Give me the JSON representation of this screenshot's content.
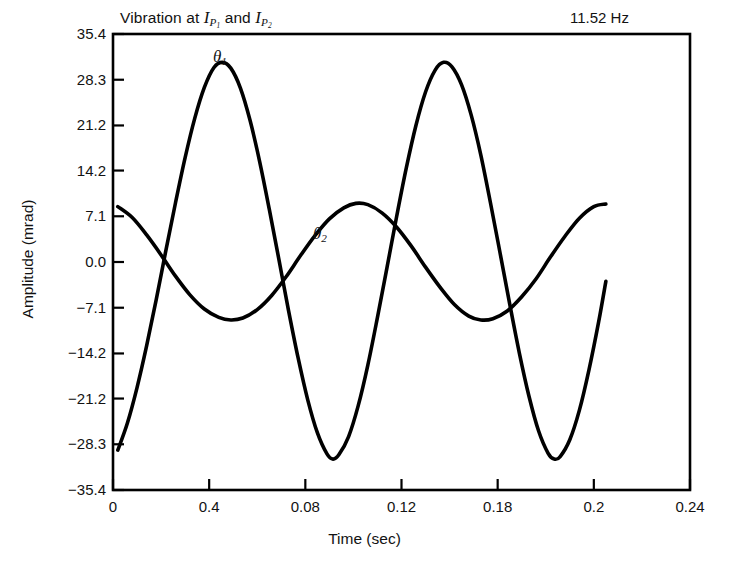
{
  "chart_data": {
    "type": "line",
    "title_parts": {
      "prefix": "Vibration at ",
      "var1": "I",
      "sub1": "P",
      "sub1sub": "1",
      "conj": " and ",
      "var2": "I",
      "sub2": "P",
      "sub2sub": "2"
    },
    "annotation": "11.52 Hz",
    "xlabel": "Time (sec)",
    "ylabel": "Amplitude (mrad)",
    "xlim": [
      0,
      0.24
    ],
    "ylim": [
      -35.4,
      35.4
    ],
    "grid": false,
    "legend": "inline-curve-labels",
    "xticks": [
      0,
      0.04,
      0.08,
      0.12,
      0.16,
      0.2,
      0.24
    ],
    "xticklabels": [
      "0",
      "0.4",
      "0.08",
      "0.12",
      "0.18",
      "0.2",
      "0.24"
    ],
    "yticks": [
      35.4,
      28.3,
      21.2,
      14.2,
      7.1,
      0.0,
      -7.1,
      -14.2,
      -21.2,
      -28.3,
      -35.4
    ],
    "yticklabels": [
      "35.4",
      "28.3",
      "21.2",
      "14.2",
      "7.1",
      "0.0",
      "−7.1",
      "−14.2",
      "−21.2",
      "−28.3",
      "−35.4"
    ],
    "series": [
      {
        "name": "θ₁",
        "label": "θ",
        "label_sub": "1",
        "color": "#000000",
        "linewidth": 3.6,
        "frequency_hz": 11.52,
        "amplitude": 31.0,
        "period": 0.0868,
        "phase_deg": 250,
        "x_start": 0.002,
        "x_end": 0.205,
        "points": [
          [
            0.002,
            -29.2
          ],
          [
            0.006,
            -25.0
          ],
          [
            0.01,
            -19.5
          ],
          [
            0.014,
            -13.0
          ],
          [
            0.018,
            -5.8
          ],
          [
            0.022,
            1.8
          ],
          [
            0.026,
            9.2
          ],
          [
            0.03,
            16.2
          ],
          [
            0.034,
            22.3
          ],
          [
            0.038,
            27.1
          ],
          [
            0.042,
            30.2
          ],
          [
            0.0455,
            31.0
          ],
          [
            0.049,
            30.1
          ],
          [
            0.053,
            27.0
          ],
          [
            0.057,
            22.0
          ],
          [
            0.061,
            15.6
          ],
          [
            0.065,
            8.2
          ],
          [
            0.069,
            0.4
          ],
          [
            0.073,
            -7.5
          ],
          [
            0.077,
            -14.9
          ],
          [
            0.081,
            -21.4
          ],
          [
            0.085,
            -26.5
          ],
          [
            0.089,
            -29.8
          ],
          [
            0.0915,
            -30.6
          ],
          [
            0.094,
            -29.9
          ],
          [
            0.098,
            -27.1
          ],
          [
            0.102,
            -22.3
          ],
          [
            0.106,
            -16.0
          ],
          [
            0.11,
            -8.6
          ],
          [
            0.114,
            -0.8
          ],
          [
            0.118,
            7.1
          ],
          [
            0.122,
            14.6
          ],
          [
            0.126,
            21.2
          ],
          [
            0.13,
            26.4
          ],
          [
            0.134,
            29.8
          ],
          [
            0.1375,
            31.0
          ],
          [
            0.141,
            30.3
          ],
          [
            0.145,
            27.5
          ],
          [
            0.149,
            22.8
          ],
          [
            0.153,
            16.6
          ],
          [
            0.157,
            9.2
          ],
          [
            0.161,
            1.4
          ],
          [
            0.165,
            -6.5
          ],
          [
            0.169,
            -14.1
          ],
          [
            0.173,
            -20.8
          ],
          [
            0.177,
            -26.2
          ],
          [
            0.181,
            -29.7
          ],
          [
            0.1835,
            -30.6
          ],
          [
            0.186,
            -30.2
          ],
          [
            0.19,
            -27.6
          ],
          [
            0.194,
            -23.0
          ],
          [
            0.198,
            -16.7
          ],
          [
            0.202,
            -9.3
          ],
          [
            0.205,
            -3.0
          ]
        ]
      },
      {
        "name": "θ₂",
        "label": "θ",
        "label_sub": "2",
        "color": "#000000",
        "linewidth": 3.6,
        "amplitude": 9.5,
        "period": 0.105,
        "x_start": 0.002,
        "x_end": 0.205,
        "points": [
          [
            0.002,
            8.6
          ],
          [
            0.008,
            6.9
          ],
          [
            0.014,
            4.2
          ],
          [
            0.02,
            1.1
          ],
          [
            0.026,
            -2.2
          ],
          [
            0.032,
            -5.1
          ],
          [
            0.038,
            -7.3
          ],
          [
            0.044,
            -8.6
          ],
          [
            0.049,
            -9.0
          ],
          [
            0.054,
            -8.7
          ],
          [
            0.06,
            -7.4
          ],
          [
            0.066,
            -5.2
          ],
          [
            0.072,
            -2.3
          ],
          [
            0.078,
            1.0
          ],
          [
            0.084,
            4.1
          ],
          [
            0.09,
            6.7
          ],
          [
            0.096,
            8.4
          ],
          [
            0.101,
            9.1
          ],
          [
            0.106,
            8.9
          ],
          [
            0.112,
            7.6
          ],
          [
            0.118,
            5.4
          ],
          [
            0.124,
            2.5
          ],
          [
            0.13,
            -0.8
          ],
          [
            0.136,
            -3.9
          ],
          [
            0.142,
            -6.6
          ],
          [
            0.148,
            -8.4
          ],
          [
            0.153,
            -9.0
          ],
          [
            0.158,
            -8.8
          ],
          [
            0.164,
            -7.6
          ],
          [
            0.17,
            -5.4
          ],
          [
            0.176,
            -2.6
          ],
          [
            0.182,
            0.8
          ],
          [
            0.188,
            4.0
          ],
          [
            0.194,
            6.8
          ],
          [
            0.2,
            8.6
          ],
          [
            0.205,
            9.0
          ]
        ]
      }
    ]
  },
  "plot_geometry": {
    "left": 113,
    "right": 690,
    "top": 34,
    "bottom": 490
  }
}
